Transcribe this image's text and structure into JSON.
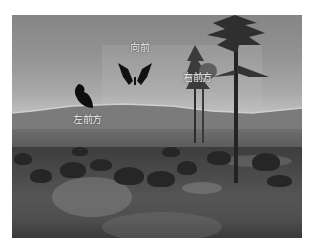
{
  "scene": {
    "description": "Grayscale 3D landscape with butterflies and direction labels",
    "colors": {
      "sky": "#8f8f8f",
      "horizon_glow": "#c8c8c8",
      "mountain": "#7a7a7a",
      "ground_dark": "#3a3a3a",
      "butterfly": "#111111",
      "label_text": "#f2f2f2"
    }
  },
  "labels": {
    "forward": "向前",
    "right_front": "右前方",
    "left_front": "左前方"
  },
  "objects": {
    "butterflies": [
      {
        "id": "forward",
        "pose": "wings-open"
      },
      {
        "id": "left_front",
        "pose": "wings-closed"
      }
    ],
    "trees": [
      {
        "id": "tall-pine",
        "position": "right"
      },
      {
        "id": "distant-pine",
        "position": "right-middle"
      }
    ]
  }
}
